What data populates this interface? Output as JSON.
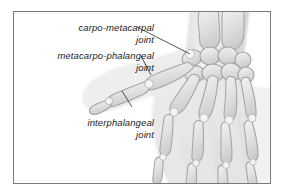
{
  "figure": {
    "frame_border_color": "#7a7a7a",
    "background_color": "#ffffff",
    "label_color": "#1c1c1c",
    "leader_line_color": "#2b2b2b",
    "bone_outline_color": "#9d9d9d",
    "bone_fill_color": "#e9e9e9",
    "soft_tissue_color": "#ececec"
  },
  "annotations": [
    {
      "name": "carpo-metacarpal-joint",
      "line1": "carpo-metacarpal",
      "line2": "joint",
      "leader": {
        "x1": 123,
        "y1": 15,
        "x2": 176,
        "y2": 42
      }
    },
    {
      "name": "metacarpo-phalangeal-joint",
      "line1": "metacarpo-phalangeal",
      "line2": "joint",
      "leader": {
        "x1": 127,
        "y1": 44,
        "x2": 137,
        "y2": 63
      }
    },
    {
      "name": "interphalangeal-joint",
      "line1": "interphalangeal",
      "line2": "joint",
      "leader": {
        "x1": 118,
        "y1": 95,
        "x2": 108,
        "y2": 79
      }
    }
  ]
}
